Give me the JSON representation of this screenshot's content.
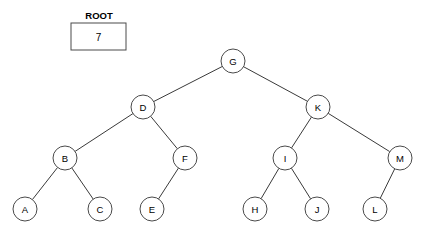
{
  "diagram": {
    "type": "binary-tree",
    "title_label": "ROOT",
    "root_pointer_value": "7",
    "colors": {
      "background": "#ffffff",
      "node_fill": "#ffffff",
      "node_stroke": "#4a4a4a",
      "edge_stroke": "#3a3a3a",
      "text": "#000000"
    },
    "root_box": {
      "caption": "ROOT",
      "value": "7",
      "x": 71,
      "y": 23,
      "width": 55,
      "height": 27,
      "caption_x": 99,
      "caption_y": 15
    },
    "node_radius": 12,
    "nodes": [
      {
        "id": "G",
        "label": "G",
        "cx": 233,
        "cy": 61,
        "level": 0
      },
      {
        "id": "D",
        "label": "D",
        "cx": 143,
        "cy": 107,
        "level": 1
      },
      {
        "id": "K",
        "label": "K",
        "cx": 318,
        "cy": 107,
        "level": 1
      },
      {
        "id": "B",
        "label": "B",
        "cx": 65,
        "cy": 158,
        "level": 2
      },
      {
        "id": "F",
        "label": "F",
        "cx": 185,
        "cy": 158,
        "level": 2
      },
      {
        "id": "I",
        "label": "I",
        "cx": 285,
        "cy": 158,
        "level": 2
      },
      {
        "id": "M",
        "label": "M",
        "cx": 400,
        "cy": 158,
        "level": 2
      },
      {
        "id": "A",
        "label": "A",
        "cx": 25,
        "cy": 209,
        "level": 3
      },
      {
        "id": "C",
        "label": "C",
        "cx": 100,
        "cy": 209,
        "level": 3
      },
      {
        "id": "E",
        "label": "E",
        "cx": 152,
        "cy": 209,
        "level": 3
      },
      {
        "id": "H",
        "label": "H",
        "cx": 255,
        "cy": 209,
        "level": 3
      },
      {
        "id": "J",
        "label": "J",
        "cx": 317,
        "cy": 209,
        "level": 3
      },
      {
        "id": "L",
        "label": "L",
        "cx": 375,
        "cy": 209,
        "level": 3
      }
    ],
    "edges": [
      {
        "from": "G",
        "to": "D",
        "side": "left"
      },
      {
        "from": "G",
        "to": "K",
        "side": "right"
      },
      {
        "from": "D",
        "to": "B",
        "side": "left"
      },
      {
        "from": "D",
        "to": "F",
        "side": "right"
      },
      {
        "from": "K",
        "to": "I",
        "side": "left"
      },
      {
        "from": "K",
        "to": "M",
        "side": "right"
      },
      {
        "from": "B",
        "to": "A",
        "side": "left"
      },
      {
        "from": "B",
        "to": "C",
        "side": "right"
      },
      {
        "from": "F",
        "to": "E",
        "side": "left"
      },
      {
        "from": "I",
        "to": "H",
        "side": "left"
      },
      {
        "from": "I",
        "to": "J",
        "side": "right"
      },
      {
        "from": "M",
        "to": "L",
        "side": "left"
      }
    ]
  }
}
